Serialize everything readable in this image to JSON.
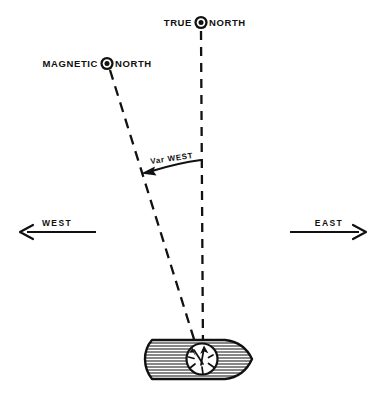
{
  "diagram": {
    "background_color": "#ffffff",
    "ink_color": "#111111",
    "width": 386,
    "height": 399
  },
  "labels": {
    "true_north": {
      "prefix": "TRUE",
      "suffix": "NORTH",
      "marker": "circled-dot-icon",
      "x": 201,
      "y": 23
    },
    "magnetic_north": {
      "prefix": "MAGNETIC",
      "suffix": "NORTH",
      "marker": "circled-dot-icon",
      "x": 107,
      "y": 64
    },
    "variation": {
      "text": "Var  WEST",
      "x": 170,
      "y": 161
    },
    "west": {
      "text": "WEST",
      "x": 55,
      "y": 226
    },
    "east": {
      "text": "EAST",
      "x": 331,
      "y": 226
    }
  },
  "lines": {
    "true_north_line": {
      "name": "true-north-dashed-line",
      "x1": 201,
      "y1": 30,
      "x2": 203,
      "y2": 350,
      "style": "dashed"
    },
    "magnetic_north_line": {
      "name": "magnetic-north-dashed-line",
      "x1": 110,
      "y1": 70,
      "x2": 198,
      "y2": 352,
      "style": "dashed"
    }
  },
  "arrows": {
    "west_arrow": {
      "direction": "left",
      "x_start": 96,
      "x_end": 20,
      "y": 232
    },
    "east_arrow": {
      "direction": "right",
      "x_start": 290,
      "x_end": 366,
      "y": 232
    },
    "variation_arc": {
      "direction": "counter-clockwise-to-magnetic",
      "from_x": 201,
      "from_y": 161,
      "to_x": 144,
      "to_y": 172
    }
  },
  "ship": {
    "name": "ship-hull",
    "bow_direction": "east",
    "hull": {
      "left": 145,
      "right": 252,
      "top": 340,
      "bottom": 379
    },
    "compass_rose": {
      "name": "compass-rose",
      "cx": 202,
      "cy": 359,
      "r": 16,
      "needles": 2
    }
  }
}
